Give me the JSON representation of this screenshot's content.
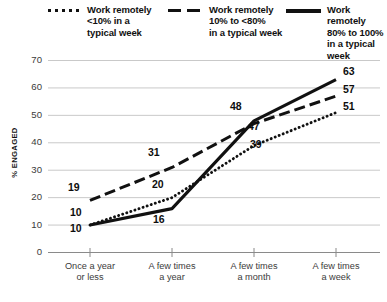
{
  "chart_data": {
    "type": "line",
    "title": "",
    "xlabel": "",
    "ylabel": "% ENGAGED",
    "ylim": [
      0,
      70
    ],
    "ystep": 10,
    "grid": true,
    "legend_position": "top",
    "yticks": [
      "70",
      "60",
      "50",
      "40",
      "30",
      "20",
      "10",
      "0"
    ],
    "categories": [
      "Once a year\nor less",
      "A few times\na year",
      "A few times\na month",
      "A few times\na week"
    ],
    "category_lines": [
      [
        "Once a year",
        "or less"
      ],
      [
        "A few times",
        "a year"
      ],
      [
        "A few times",
        "a month"
      ],
      [
        "A few times",
        "a week"
      ]
    ],
    "series": [
      {
        "name": "Work remotely <10% in a typical week",
        "style": "dotted",
        "color": "#111111",
        "values": [
          10,
          20,
          39,
          51
        ]
      },
      {
        "name": "Work remotely 10% to <80% in a typical week",
        "style": "dashed",
        "color": "#111111",
        "values": [
          19,
          31,
          47,
          57
        ]
      },
      {
        "name": "Work remotely 80% to 100% in a typical week",
        "style": "solid",
        "color": "#111111",
        "values": [
          10,
          16,
          48,
          63
        ]
      }
    ]
  },
  "legend": {
    "items": [
      {
        "marker": "dotted-line-icon",
        "line1": "Work remotely",
        "line2": "<10% in a",
        "line3": "typical week"
      },
      {
        "marker": "dashed-line-icon",
        "line1": "Work remotely",
        "line2": "10% to <80%",
        "line3": "in a typical week"
      },
      {
        "marker": "solid-line-icon",
        "line1": "Work remotely",
        "line2": "80% to 100%",
        "line3": "in a typical week"
      }
    ]
  },
  "axis": {
    "y_label": "% ENGAGED",
    "y_ticks": [
      "70",
      "60",
      "50",
      "40",
      "30",
      "20",
      "10",
      "0"
    ],
    "x_ticks": [
      {
        "l1": "Once a year",
        "l2": "or less"
      },
      {
        "l1": "A few times",
        "l2": "a year"
      },
      {
        "l1": "A few times",
        "l2": "a month"
      },
      {
        "l1": "A few times",
        "l2": "a week"
      }
    ]
  },
  "data_labels": [
    {
      "text": "19",
      "series": "dashed",
      "category": 0
    },
    {
      "text": "10",
      "series": "dotted",
      "category": 0
    },
    {
      "text": "10",
      "series": "solid",
      "category": 0
    },
    {
      "text": "31",
      "series": "dashed",
      "category": 1
    },
    {
      "text": "20",
      "series": "dotted",
      "category": 1
    },
    {
      "text": "16",
      "series": "solid",
      "category": 1
    },
    {
      "text": "48",
      "series": "solid",
      "category": 2
    },
    {
      "text": "47",
      "series": "dashed",
      "category": 2
    },
    {
      "text": "39",
      "series": "dotted",
      "category": 2
    },
    {
      "text": "63",
      "series": "solid",
      "category": 3
    },
    {
      "text": "57",
      "series": "dashed",
      "category": 3
    },
    {
      "text": "51",
      "series": "dotted",
      "category": 3
    }
  ],
  "colors": {
    "ink": "#111111",
    "grid": "#c9c9c9",
    "axis": "#8a8a8a",
    "tick_text": "#3b3b3b",
    "background": "#ffffff"
  }
}
